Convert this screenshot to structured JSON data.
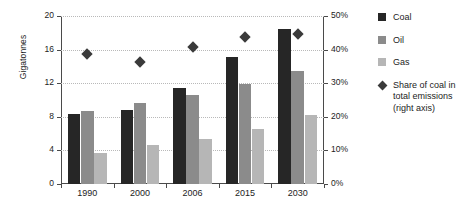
{
  "chart_data": {
    "type": "bar",
    "title": "",
    "subtitle": "",
    "xlabel": "",
    "ylabel": "Gigatonnes",
    "categories": [
      "1990",
      "2000",
      "2006",
      "2015",
      "2030"
    ],
    "ylim": [
      0,
      20
    ],
    "y_ticks": [
      "0",
      "4",
      "8",
      "12",
      "16",
      "20"
    ],
    "y_tick_values": [
      0,
      4,
      8,
      12,
      16,
      20
    ],
    "y2label": "",
    "y2lim": [
      0,
      50
    ],
    "y2_ticks": [
      "0%",
      "10%",
      "20%",
      "30%",
      "40%",
      "50%"
    ],
    "y2_tick_values": [
      0,
      10,
      20,
      30,
      40,
      50
    ],
    "grid": true,
    "legend_position": "right",
    "series": [
      {
        "name": "Coal",
        "color": "#262626",
        "axis": "left",
        "kind": "bar",
        "values": [
          8.3,
          8.8,
          11.4,
          15.1,
          18.4
        ]
      },
      {
        "name": "Oil",
        "color": "#8b8b8b",
        "axis": "left",
        "kind": "bar",
        "values": [
          8.7,
          9.6,
          10.6,
          11.9,
          13.5
        ]
      },
      {
        "name": "Gas",
        "color": "#b6b6b6",
        "axis": "left",
        "kind": "bar",
        "values": [
          3.7,
          4.7,
          5.3,
          6.5,
          8.2
        ]
      },
      {
        "name": "Share of coal in total emissions (right axis)",
        "color": "#3a3a3a",
        "axis": "right",
        "kind": "scatter",
        "marker": "diamond",
        "values": [
          40.0,
          37.5,
          42.0,
          45.0,
          45.8
        ]
      }
    ]
  },
  "legend": {
    "items": [
      {
        "label": "Coal",
        "swatch": "coal-swatch"
      },
      {
        "label": "Oil",
        "swatch": "oil-swatch"
      },
      {
        "label": "Gas",
        "swatch": "gas-swatch"
      },
      {
        "label": "Share of coal in total emissions (right axis)",
        "swatch": "diamond-marker"
      }
    ]
  }
}
